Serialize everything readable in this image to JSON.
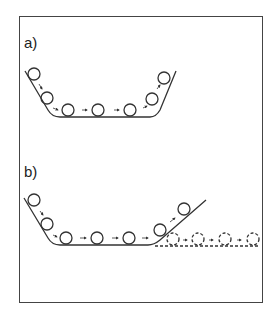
{
  "figure": {
    "panels": [
      {
        "id": "a",
        "label": "a)",
        "description": "Balls roll down left slope, along flat bottom, and up right slope of a U-shaped trough"
      },
      {
        "id": "b",
        "label": "b)",
        "description": "Same trough with shallower right slope; balls roll further up; dashed balls continue along dashed horizontal extension"
      }
    ]
  },
  "colors": {
    "stroke": "#333333",
    "frame": "#444444",
    "background": "#ffffff"
  }
}
